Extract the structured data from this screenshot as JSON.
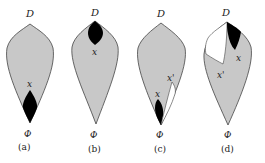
{
  "colors": {
    "fill": "#c8c8c8",
    "outline": "#444444",
    "dark_region": "#000000",
    "white_region": "#ffffff",
    "text": "#222222"
  },
  "panels": [
    {
      "id": "a",
      "top_label": "D",
      "bottom_label": "Φ",
      "caption": "(a)",
      "region_labels": [
        "x"
      ]
    },
    {
      "id": "b",
      "top_label": "D",
      "bottom_label": "Φ",
      "caption": "(b)",
      "region_labels": [
        "x"
      ]
    },
    {
      "id": "c",
      "top_label": "D",
      "bottom_label": "Φ",
      "caption": "(c)",
      "region_labels": [
        "x",
        "x'"
      ]
    },
    {
      "id": "d",
      "top_label": "D",
      "bottom_label": "Φ",
      "caption": "(d)",
      "region_labels": [
        "x",
        "x'"
      ]
    }
  ]
}
